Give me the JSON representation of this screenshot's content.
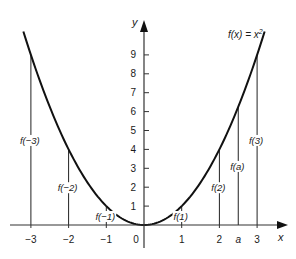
{
  "chart_data": {
    "type": "line",
    "function": "x^2",
    "title_parts": {
      "main": "f(x) = x",
      "sup": "2"
    },
    "xlabel": "x",
    "ylabel": "y",
    "xlim": [
      -3.2,
      3.6
    ],
    "ylim": [
      0,
      9.8
    ],
    "grid": false,
    "legend": "none",
    "x_ticks": [
      {
        "value": -3,
        "label": "−3"
      },
      {
        "value": -2,
        "label": "−2"
      },
      {
        "value": -1,
        "label": "−1"
      },
      {
        "value": 0,
        "label": "0"
      },
      {
        "value": 1,
        "label": "1"
      },
      {
        "value": 2,
        "label": "2"
      },
      {
        "value": 2.5,
        "label": "a"
      },
      {
        "value": 3,
        "label": "3"
      }
    ],
    "y_ticks": [
      {
        "value": 1,
        "label": "1"
      },
      {
        "value": 2,
        "label": "2"
      },
      {
        "value": 3,
        "label": "3"
      },
      {
        "value": 4,
        "label": "4"
      },
      {
        "value": 5,
        "label": "5"
      },
      {
        "value": 6,
        "label": "6"
      },
      {
        "value": 7,
        "label": "7"
      },
      {
        "value": 8,
        "label": "8"
      },
      {
        "value": 9,
        "label": "9"
      }
    ],
    "curve_x_range": [
      -3.2,
      3.2
    ],
    "vertical_segments": [
      {
        "x": -3,
        "y": 9,
        "label": "f(−3)",
        "label_side": "left"
      },
      {
        "x": -2,
        "y": 4,
        "label": "f(−2)",
        "label_side": "left"
      },
      {
        "x": -1,
        "y": 1,
        "label": "f(−1)",
        "label_side": "left"
      },
      {
        "x": 1,
        "y": 1,
        "label": "f(1)",
        "label_side": "left"
      },
      {
        "x": 2,
        "y": 4,
        "label": "f(2)",
        "label_side": "left"
      },
      {
        "x": 2.5,
        "y": 6.25,
        "label": "f(a)",
        "label_side": "left"
      },
      {
        "x": 3,
        "y": 9,
        "label": "f(3)",
        "label_side": "left"
      }
    ]
  }
}
